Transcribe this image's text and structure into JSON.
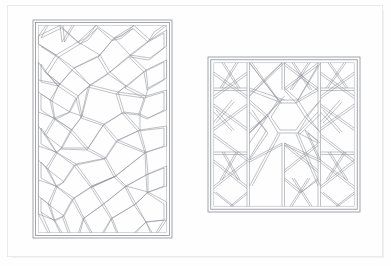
{
  "document": {
    "kind": "scanned-plate",
    "page_background": "#fefefe",
    "border_color": "#e9eaec",
    "caption": "",
    "title": ""
  },
  "palette": {
    "line": "#8d9097",
    "line_light": "#a8abb2",
    "frame": "#7c7f86",
    "paper": "#fefefe",
    "page_border": "#e9eaec",
    "shadow": "#f2f2f4"
  },
  "figures": [
    {
      "id": "panel-left",
      "label": "rectangular-strapwork-panel",
      "shape": "rectangle",
      "orientation": "portrait",
      "bounds": {
        "x": 33,
        "y": 20,
        "width": 139,
        "height": 218
      },
      "border_bands": 2,
      "motif": "irregular polygonal strapwork lattice",
      "central_motif": "large irregular heptagon",
      "line_style": "double-line strapwork",
      "stroke_width": 0.55
    },
    {
      "id": "panel-right",
      "label": "square-strapwork-panel",
      "shape": "square",
      "orientation": "square",
      "bounds": {
        "x": 208,
        "y": 57,
        "width": 152,
        "height": 155
      },
      "border_bands": 2,
      "motif": "interlaced star-and-polygon strapwork lattice",
      "central_motif": "central hexagon",
      "line_style": "double-line strapwork",
      "stroke_width": 0.55
    }
  ]
}
